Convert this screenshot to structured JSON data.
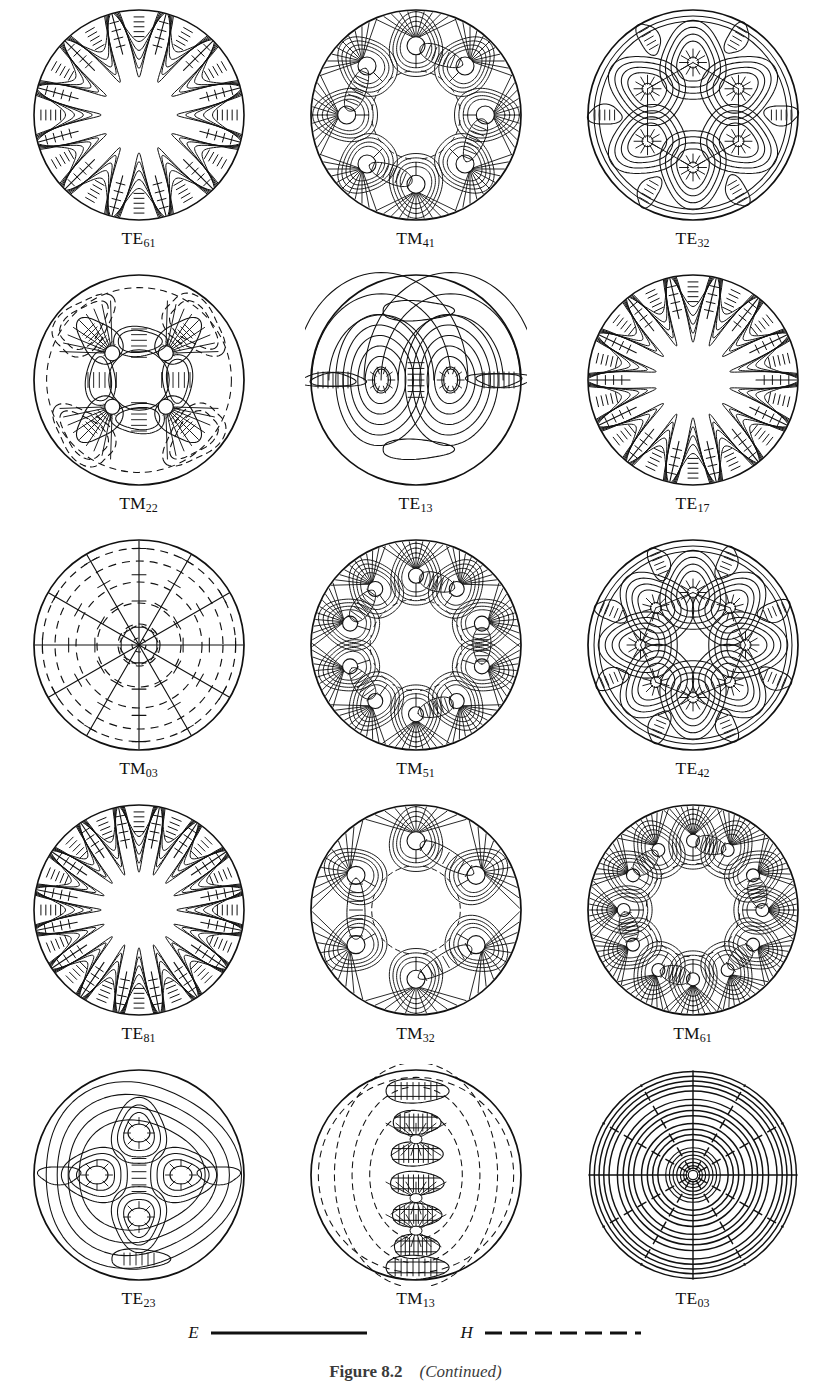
{
  "figure": {
    "caption_label": "Figure 8.2",
    "caption_note": "(Continued)",
    "caption_full": "Figure 8.2  (Continued)"
  },
  "legend": {
    "e_symbol": "E",
    "e_style": "solid",
    "e_description": "E  ——————",
    "h_symbol": "H",
    "h_style": "dashed",
    "h_description": "H  – – – – – –",
    "line_color": "#111111"
  },
  "grid": {
    "rows": 5,
    "columns": 3,
    "total_modes": 15
  },
  "modes": [
    {
      "id": "TE61",
      "family": "TE",
      "m": 6,
      "n": 1,
      "label_main": "TE",
      "label_sub": "61",
      "pattern": "whispering-gallery",
      "azimuthal_lobes": 12,
      "radial_rings": 1,
      "has_nodes": false,
      "node_count": 0,
      "dashed_h": false,
      "row": 1,
      "column": 1
    },
    {
      "id": "TM41",
      "family": "TM",
      "m": 4,
      "n": 1,
      "label_main": "TM",
      "label_sub": "41",
      "pattern": "node-ring",
      "azimuthal_lobes": 8,
      "radial_rings": 1,
      "has_nodes": true,
      "node_count": 8,
      "dashed_h": true,
      "row": 1,
      "column": 2
    },
    {
      "id": "TE32",
      "family": "TE",
      "m": 3,
      "n": 2,
      "label_main": "TE",
      "label_sub": "32",
      "pattern": "cell-loops",
      "azimuthal_lobes": 6,
      "radial_rings": 2,
      "has_nodes": false,
      "node_count": 6,
      "dashed_h": false,
      "row": 1,
      "column": 3
    },
    {
      "id": "TM22",
      "family": "TM",
      "m": 2,
      "n": 2,
      "label_main": "TM",
      "label_sub": "22",
      "pattern": "node-square",
      "azimuthal_lobes": 4,
      "radial_rings": 2,
      "has_nodes": true,
      "node_count": 4,
      "dashed_h": true,
      "row": 2,
      "column": 1
    },
    {
      "id": "TE13",
      "family": "TE",
      "m": 1,
      "n": 3,
      "label_main": "TE",
      "label_sub": "13",
      "pattern": "dipole-nested",
      "azimuthal_lobes": 2,
      "radial_rings": 3,
      "has_nodes": false,
      "node_count": 2,
      "dashed_h": false,
      "row": 2,
      "column": 2
    },
    {
      "id": "TE17",
      "family": "TE",
      "m": 1,
      "n": 7,
      "label_main": "TE",
      "label_sub": "17",
      "pattern": "whispering-gallery",
      "azimuthal_lobes": 14,
      "radial_rings": 1,
      "has_nodes": false,
      "node_count": 0,
      "dashed_h": false,
      "row": 2,
      "column": 3
    },
    {
      "id": "TM03",
      "family": "TM",
      "m": 0,
      "n": 3,
      "label_main": "TM",
      "label_sub": "03",
      "pattern": "radial-spokes",
      "azimuthal_lobes": 0,
      "radial_rings": 3,
      "has_nodes": false,
      "node_count": 0,
      "dashed_h": true,
      "row": 3,
      "column": 1
    },
    {
      "id": "TM51",
      "family": "TM",
      "m": 5,
      "n": 1,
      "label_main": "TM",
      "label_sub": "51",
      "pattern": "node-ring",
      "azimuthal_lobes": 10,
      "radial_rings": 1,
      "has_nodes": true,
      "node_count": 10,
      "dashed_h": true,
      "row": 3,
      "column": 2
    },
    {
      "id": "TE42",
      "family": "TE",
      "m": 4,
      "n": 2,
      "label_main": "TE",
      "label_sub": "42",
      "pattern": "cell-loops",
      "azimuthal_lobes": 8,
      "radial_rings": 2,
      "has_nodes": false,
      "node_count": 8,
      "dashed_h": false,
      "row": 3,
      "column": 3
    },
    {
      "id": "TE81",
      "family": "TE",
      "m": 8,
      "n": 1,
      "label_main": "TE",
      "label_sub": "81",
      "pattern": "whispering-gallery",
      "azimuthal_lobes": 16,
      "radial_rings": 1,
      "has_nodes": false,
      "node_count": 0,
      "dashed_h": false,
      "row": 4,
      "column": 1
    },
    {
      "id": "TM32",
      "family": "TM",
      "m": 3,
      "n": 2,
      "label_main": "TM",
      "label_sub": "32",
      "pattern": "node-ring",
      "azimuthal_lobes": 6,
      "radial_rings": 2,
      "has_nodes": true,
      "node_count": 6,
      "dashed_h": true,
      "row": 4,
      "column": 2
    },
    {
      "id": "TM61",
      "family": "TM",
      "m": 6,
      "n": 1,
      "label_main": "TM",
      "label_sub": "61",
      "pattern": "node-ring",
      "azimuthal_lobes": 12,
      "radial_rings": 1,
      "has_nodes": true,
      "node_count": 12,
      "dashed_h": true,
      "row": 4,
      "column": 3
    },
    {
      "id": "TE23",
      "family": "TE",
      "m": 2,
      "n": 3,
      "label_main": "TE",
      "label_sub": "23",
      "pattern": "quad-cells",
      "azimuthal_lobes": 4,
      "radial_rings": 3,
      "has_nodes": false,
      "node_count": 4,
      "dashed_h": false,
      "row": 5,
      "column": 1
    },
    {
      "id": "TM13",
      "family": "TM",
      "m": 1,
      "n": 3,
      "label_main": "TM",
      "label_sub": "13",
      "pattern": "vertical-chain",
      "azimuthal_lobes": 2,
      "radial_rings": 3,
      "has_nodes": false,
      "node_count": 6,
      "dashed_h": true,
      "row": 5,
      "column": 2
    },
    {
      "id": "TE03",
      "family": "TE",
      "m": 0,
      "n": 3,
      "label_main": "TE",
      "label_sub": "03",
      "pattern": "concentric-rings",
      "azimuthal_lobes": 0,
      "radial_rings": 3,
      "has_nodes": false,
      "node_count": 0,
      "dashed_h": true,
      "row": 5,
      "column": 3
    }
  ]
}
